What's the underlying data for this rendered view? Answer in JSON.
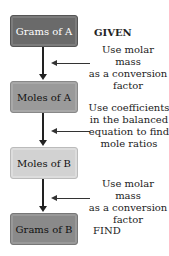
{
  "boxes": [
    {
      "label": "Grams of A",
      "fill": "#6a6a6a",
      "text_color": "#ffffff"
    },
    {
      "label": "Moles of A",
      "fill": "#9a9a9a",
      "text_color": "#111111"
    },
    {
      "label": "Moles of B",
      "fill": "#d2d2d2",
      "text_color": "#111111"
    },
    {
      "label": "Grams of B",
      "fill": "#8a8a8a",
      "text_color": "#111111"
    }
  ],
  "tags": {
    "given": "GIVEN",
    "find": "FIND"
  },
  "steps": [
    {
      "lines": [
        "Use molar mass",
        "as a conversion",
        "factor"
      ]
    },
    {
      "lines": [
        "Use coefficients",
        "in the balanced",
        "equation to find",
        "mole ratios"
      ]
    },
    {
      "lines": [
        "Use molar mass",
        "as a conversion",
        "factor"
      ]
    }
  ]
}
